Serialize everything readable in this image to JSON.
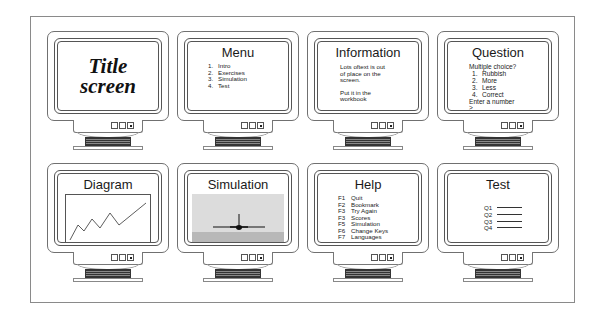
{
  "monitors": [
    {
      "id": "title",
      "title_line1": "Title",
      "title_line2": "screen"
    },
    {
      "id": "menu",
      "heading": "Menu",
      "items": [
        {
          "num": "1.",
          "label": "Intro"
        },
        {
          "num": "2.",
          "label": "Exercises"
        },
        {
          "num": "3.",
          "label": "Simulation"
        },
        {
          "num": "4.",
          "label": "Test"
        }
      ]
    },
    {
      "id": "information",
      "heading": "Information",
      "para1": [
        "Lots oftext is out",
        "of place on the",
        "screen."
      ],
      "para2": [
        "Put it in the",
        "workbook"
      ]
    },
    {
      "id": "question",
      "heading": "Question",
      "prompt": "Multiple choice?",
      "options": [
        {
          "num": "1.",
          "label": "Rubbish"
        },
        {
          "num": "2.",
          "label": "More"
        },
        {
          "num": "3.",
          "label": "Less"
        },
        {
          "num": "4.",
          "label": "Correct"
        }
      ],
      "instruction": "Enter a number",
      "cursor": ">_"
    },
    {
      "id": "diagram",
      "heading": "Diagram",
      "line_points": "4,45 12,30 18,36 26,24 34,33 44,18 53,30 80,8"
    },
    {
      "id": "simulation",
      "heading": "Simulation"
    },
    {
      "id": "help",
      "heading": "Help",
      "keys": [
        {
          "key": "F1",
          "label": "Quit"
        },
        {
          "key": "F2",
          "label": "Bookmark"
        },
        {
          "key": "F3",
          "label": "Try Again"
        },
        {
          "key": "F3",
          "label": "Scores"
        },
        {
          "key": "F5",
          "label": "Simulation"
        },
        {
          "key": "F6",
          "label": "Change Keys"
        },
        {
          "key": "F7",
          "label": "Languages"
        }
      ]
    },
    {
      "id": "test",
      "heading": "Test",
      "questions": [
        "Q1",
        "Q2",
        "Q3",
        "Q4"
      ]
    }
  ]
}
